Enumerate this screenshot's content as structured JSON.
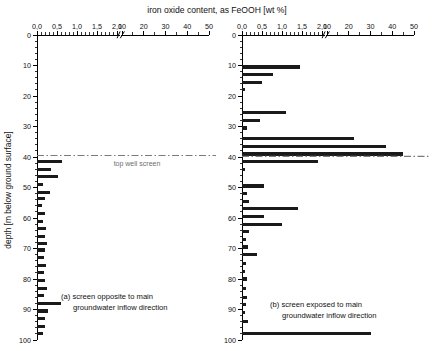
{
  "figure": {
    "title": "iron oxide content, as FeOOH [wt %]",
    "ylabel": "depth [m below ground surface]",
    "background_color": "#ffffff",
    "bar_color": "#1a1a1a",
    "screen_line_color": "#7a7a7a"
  },
  "axes": {
    "x": {
      "label": "iron oxide content, as FeOOH [wt %]",
      "tick_labels": [
        "0,0",
        "0,5",
        "1,0",
        "1,5",
        "2,0",
        "10",
        "20",
        "30",
        "40",
        "50"
      ],
      "tick_values": [
        0.0,
        0.5,
        1.0,
        1.5,
        2.0,
        10,
        20,
        30,
        40,
        50
      ],
      "broken": true,
      "break_after": 2.0,
      "break_symbol": "//",
      "lower_segment_range": [
        0.0,
        2.0
      ],
      "upper_segment_range": [
        10,
        50
      ],
      "minor_tick_step_lower": 0.1,
      "minor_tick_step_upper": 5
    },
    "y": {
      "label": "depth [m below ground surface]",
      "tick_labels": [
        "0",
        "10",
        "20",
        "30",
        "40",
        "50",
        "60",
        "70",
        "80",
        "90",
        "100"
      ],
      "tick_values": [
        0,
        10,
        20,
        30,
        40,
        50,
        60,
        70,
        80,
        90,
        100
      ],
      "range": [
        0,
        100
      ],
      "direction": "inverted",
      "minor_tick_step": 2
    },
    "grid": false,
    "legend": "none"
  },
  "panels": [
    {
      "id": "panel-a",
      "caption_line1": "(a) screen opposite to main",
      "caption_line2": "groundwater inflow direction",
      "annotation": {
        "text": "top well screen",
        "depth_m": 39.5
      }
    },
    {
      "id": "panel-b",
      "caption_line1": "(b) screen exposed to main",
      "caption_line2": "groundwater inflow direction",
      "annotation": {
        "text": "",
        "depth_m": 39.8
      }
    }
  ],
  "chart_data": [
    {
      "type": "bar",
      "orientation": "horizontal",
      "title": "(a) screen opposite to main groundwater inflow direction",
      "xlabel": "iron oxide content, as FeOOH [wt %]",
      "ylabel": "depth [m below ground surface]",
      "xlim": [
        0,
        50
      ],
      "ylim": [
        0,
        100
      ],
      "grid": false,
      "legend": null,
      "categories": [
        41.5,
        44.0,
        46.5,
        49.0,
        51.5,
        53.5,
        56.0,
        58.5,
        61.0,
        63.5,
        66.0,
        68.5,
        70.5,
        73.0,
        75.5,
        78.0,
        80.5,
        83.0,
        85.5,
        88.0,
        90.5,
        93.0,
        95.5,
        98.0
      ],
      "categories_label": "depth_m",
      "values": [
        0.62,
        0.34,
        0.52,
        0.16,
        0.33,
        0.2,
        0.13,
        0.21,
        0.15,
        0.23,
        0.19,
        0.24,
        0.21,
        0.17,
        0.22,
        0.18,
        0.2,
        0.24,
        0.17,
        0.59,
        0.28,
        0.21,
        0.19,
        0.14
      ],
      "values_label": "FeOOH_wt_pct",
      "annotations": [
        {
          "text": "top well screen",
          "y": 39.5,
          "type": "hline",
          "style": "dash-dot"
        }
      ]
    },
    {
      "type": "bar",
      "orientation": "horizontal",
      "title": "(b) screen exposed to main groundwater inflow direction",
      "xlabel": "iron oxide content, as FeOOH [wt %]",
      "ylabel": "depth [m below ground surface]",
      "xlim": [
        0,
        50
      ],
      "ylim": [
        0,
        100
      ],
      "grid": false,
      "legend": null,
      "categories": [
        10.5,
        13.0,
        15.5,
        18.0,
        25.5,
        28.0,
        30.5,
        34.0,
        36.5,
        39.0,
        41.5,
        44.0,
        49.5,
        52.0,
        54.5,
        57.0,
        59.5,
        62.0,
        64.5,
        67.0,
        69.5,
        72.0,
        75.0,
        77.5,
        80.0,
        83.0,
        86.0,
        88.5,
        91.0,
        94.0,
        98.0
      ],
      "categories_label": "depth_m",
      "values": [
        1.45,
        0.78,
        0.49,
        0.07,
        1.1,
        0.46,
        0.12,
        22.5,
        37.0,
        45.0,
        1.9,
        0.08,
        0.55,
        0.12,
        0.17,
        1.4,
        0.55,
        1.0,
        0.18,
        0.09,
        0.15,
        0.37,
        0.11,
        0.08,
        0.12,
        0.09,
        0.13,
        0.1,
        0.08,
        0.16,
        30.0
      ],
      "values_label": "FeOOH_wt_pct",
      "annotations": [
        {
          "text": "",
          "y": 39.8,
          "type": "hline",
          "style": "dash-dot"
        }
      ]
    }
  ]
}
